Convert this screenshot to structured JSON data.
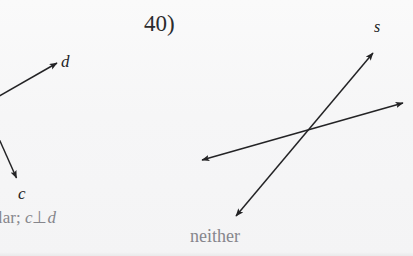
{
  "page": {
    "background_color": "#f7f7f8",
    "width": 413,
    "height": 256,
    "ink_color": "#232325",
    "answer_color": "#86868c",
    "number_color": "#2b2b2d"
  },
  "problems": [
    {
      "id": "left-problem",
      "number": "",
      "note": "cropped at left edge of scan",
      "diagram": {
        "type": "two-rays",
        "rays": [
          {
            "label": "d",
            "direction": "up-right",
            "from": [
              0,
              96
            ],
            "to": [
              59,
              62
            ],
            "arrowheads": [
              "end"
            ]
          },
          {
            "label": "c",
            "direction": "down-right",
            "from": [
              0,
              141
            ],
            "to": [
              18,
              181
            ],
            "arrowheads": [
              "end"
            ]
          }
        ]
      },
      "answer_text": "lar; ",
      "answer_relation_left": "c",
      "answer_relation_symbol": "⊥",
      "answer_relation_right": "d",
      "answer_full": "lar; c ⊥ d"
    },
    {
      "id": "problem-40",
      "number": "40)",
      "diagram": {
        "type": "two-crossing-lines",
        "lines": [
          {
            "label": "s",
            "from": [
              232,
              221
            ],
            "to": [
              376,
              49
            ],
            "arrowheads": [
              "start",
              "end"
            ]
          },
          {
            "label": "",
            "from": [
              198,
              161
            ],
            "to": [
              407,
              101
            ],
            "arrowheads": [
              "start",
              "end"
            ]
          }
        ],
        "intersection": [
          303,
          133
        ]
      },
      "answer_text": "neither"
    }
  ],
  "labels": {
    "ray_d": "d",
    "ray_c": "c",
    "line_s": "s",
    "problem_40": "40)",
    "answer_neither": "neither",
    "answer_perpendicular_fragment": "lar; ",
    "perp_symbol": "⊥",
    "var_c": "c",
    "var_d": "d"
  }
}
